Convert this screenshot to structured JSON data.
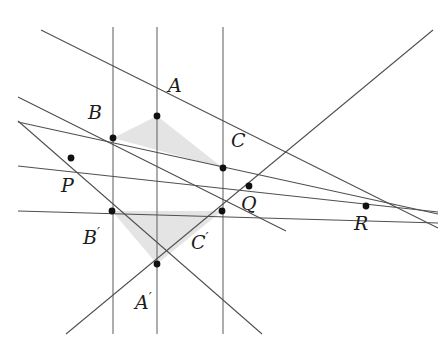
{
  "figure": {
    "width": 445,
    "height": 352,
    "background": "#ffffff",
    "line_color": "#5a5a5a",
    "dark_line_color": "#3c3c3c",
    "point_color": "#111111",
    "shade_color": "#e2e2e2",
    "label_color": "#1b1b1b"
  },
  "labels": {
    "A": "A",
    "B": "B",
    "C": "C",
    "A_prime_base": "A",
    "B_prime_base": "B",
    "C_prime_base": "C",
    "prime_mark": "′",
    "P": "P",
    "Q": "Q",
    "R": "R"
  },
  "points": [
    {
      "id": "A",
      "label": "A",
      "x": 157,
      "y": 116
    },
    {
      "id": "B",
      "label": "B",
      "x": 113,
      "y": 138
    },
    {
      "id": "C",
      "label": "C",
      "x": 223,
      "y": 168
    },
    {
      "id": "Ap",
      "label": "A'",
      "x": 157,
      "y": 264
    },
    {
      "id": "Bp",
      "label": "B'",
      "x": 112,
      "y": 211
    },
    {
      "id": "Cp",
      "label": "C'",
      "x": 222,
      "y": 211
    },
    {
      "id": "P",
      "label": "P",
      "x": 71,
      "y": 158
    },
    {
      "id": "Q",
      "label": "Q",
      "x": 249,
      "y": 186
    },
    {
      "id": "R",
      "label": "R",
      "x": 366,
      "y": 206
    }
  ],
  "label_positions": [
    {
      "id": "A",
      "text": "A",
      "x": 168,
      "y": 76,
      "primed": false
    },
    {
      "id": "B",
      "text": "B",
      "x": 88,
      "y": 103,
      "primed": false
    },
    {
      "id": "C",
      "text": "C",
      "x": 231,
      "y": 131,
      "primed": false
    },
    {
      "id": "Ap",
      "text": "A",
      "x": 135,
      "y": 291,
      "primed": true
    },
    {
      "id": "Bp",
      "text": "B",
      "x": 83,
      "y": 226,
      "primed": true
    },
    {
      "id": "Cp",
      "text": "C",
      "x": 191,
      "y": 231,
      "primed": true
    },
    {
      "id": "P",
      "text": "P",
      "x": 61,
      "y": 176,
      "primed": false
    },
    {
      "id": "Q",
      "text": "Q",
      "x": 241,
      "y": 194,
      "primed": false
    },
    {
      "id": "R",
      "text": "R",
      "x": 354,
      "y": 214,
      "primed": false
    }
  ],
  "vertical_lines": [
    {
      "id": "line-BB-prime",
      "x": 113,
      "y1": 27,
      "y2": 333
    },
    {
      "id": "line-AA-prime",
      "x": 157,
      "y1": 27,
      "y2": 333
    },
    {
      "id": "line-CC-prime",
      "x": 223,
      "y1": 27,
      "y2": 333
    }
  ],
  "segment_lines": [
    {
      "id": "line-AB-P",
      "x1": 18,
      "y1": 95,
      "x2": 280,
      "y2": 226
    },
    {
      "id": "line-AC-Q",
      "x1": 41,
      "y1": 30,
      "x2": 430,
      "y2": 225
    },
    {
      "id": "line-BC-R",
      "x1": 18,
      "y1": 122,
      "x2": 438,
      "y2": 215
    },
    {
      "id": "line-ApBp-P",
      "x1": 18,
      "y1": 122,
      "x2": 260,
      "y2": 334
    },
    {
      "id": "line-ApCp-Q",
      "x1": 65,
      "y1": 334,
      "x2": 430,
      "y2": 146
    },
    {
      "id": "line-BpCp-R",
      "x1": 18,
      "y1": 211,
      "x2": 438,
      "y2": 222
    },
    {
      "id": "line-PQR",
      "x1": 18,
      "y1": 169,
      "x2": 438,
      "y2": 212
    },
    {
      "id": "line-through-A-right",
      "x1": 157,
      "y1": 116,
      "x2": 362,
      "y2": 32
    },
    {
      "id": "line-through-Ap-right",
      "x1": 157,
      "y1": 264,
      "x2": 320,
      "y2": 334
    }
  ],
  "shaded_triangles": [
    {
      "id": "triangle-ABC",
      "vertices": "A,B,C"
    },
    {
      "id": "triangle-ApBpCp",
      "vertices": "A',B',C'"
    }
  ],
  "geometry_notes": {
    "center_of_perspectivity": "point at infinity (vertical direction)",
    "axis_of_perspectivity": "line through P, Q, R"
  }
}
